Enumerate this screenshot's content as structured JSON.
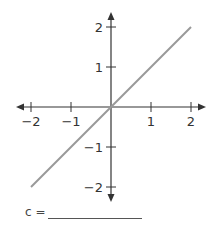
{
  "chart_data": {
    "type": "line",
    "title": "",
    "xlabel": "",
    "ylabel": "",
    "xlim": [
      -2,
      2
    ],
    "ylim": [
      -2,
      2
    ],
    "grid": false,
    "x_ticks": [
      -2,
      -1,
      1,
      2
    ],
    "y_ticks": [
      2,
      1,
      -1,
      -2
    ],
    "x_tick_labels": [
      "−2",
      "−1",
      "1",
      "2"
    ],
    "y_tick_labels": [
      "2",
      "1",
      "−1",
      "−2"
    ],
    "series": [
      {
        "name": "line",
        "x": [
          -2,
          2
        ],
        "y": [
          -2,
          2
        ],
        "color": "#999999"
      }
    ],
    "axis_color": "#333333"
  },
  "answer": {
    "label": "c ="
  }
}
